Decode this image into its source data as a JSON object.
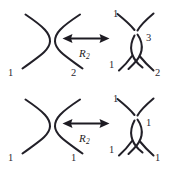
{
  "figure": {
    "background_color": "#ffffff",
    "stroke_color": "#222028",
    "width": 172,
    "height": 170
  },
  "rows": [
    {
      "id": "row-top",
      "name": "first-r2-move",
      "left_diagram": {
        "name": "two-uncrossed-arcs",
        "description": "Two opposing arcs that do not cross",
        "labels": [
          {
            "text": "1",
            "position": "bottom-left"
          },
          {
            "text": "2",
            "position": "bottom-right"
          }
        ]
      },
      "arrow": {
        "name": "double-headed-arrow",
        "direction": "bidirectional",
        "move_label": "R",
        "move_subscript": "2"
      },
      "right_diagram": {
        "name": "two-crossed-arcs-bigon",
        "description": "Two arcs crossing twice forming a bigon lens region",
        "labels": [
          {
            "text": "1",
            "position": "top-left"
          },
          {
            "text": "3",
            "position": "middle-right"
          },
          {
            "text": "1",
            "position": "bottom-left"
          },
          {
            "text": "2",
            "position": "bottom-right"
          }
        ]
      }
    },
    {
      "id": "row-bottom",
      "name": "second-r2-move",
      "left_diagram": {
        "name": "two-uncrossed-arcs",
        "description": "Two opposing arcs that do not cross",
        "labels": [
          {
            "text": "1",
            "position": "bottom-left"
          },
          {
            "text": "1",
            "position": "bottom-right"
          }
        ]
      },
      "arrow": {
        "name": "double-headed-arrow",
        "direction": "bidirectional",
        "move_label": "R",
        "move_subscript": "2"
      },
      "right_diagram": {
        "name": "two-crossed-arcs-bigon",
        "description": "Two arcs crossing twice forming a bigon lens region",
        "labels": [
          {
            "text": "1",
            "position": "top-left"
          },
          {
            "text": "1",
            "position": "middle-right"
          },
          {
            "text": "1",
            "position": "bottom-left"
          },
          {
            "text": "1",
            "position": "bottom-right"
          }
        ]
      }
    }
  ]
}
